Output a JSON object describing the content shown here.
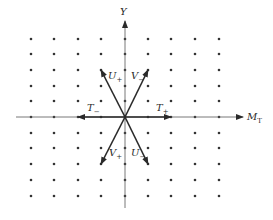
{
  "diagram": {
    "colors": {
      "background": "#ffffff",
      "ink": "#2a2a2a",
      "dot": "#333333"
    },
    "axes": {
      "x": {
        "label": "M",
        "subscript": "T"
      },
      "y": {
        "label": "Y"
      }
    },
    "grid": {
      "columns": 9,
      "rows": 11,
      "x_positions": [
        31,
        54,
        78,
        101,
        125,
        148,
        171,
        195,
        219
      ],
      "y_positions": [
        39,
        54,
        70,
        86,
        101,
        117,
        133,
        148,
        164,
        180,
        196
      ],
      "origin": [
        125,
        117
      ]
    },
    "operators": [
      {
        "id": "T_plus",
        "label": "T",
        "sign": "+",
        "to": [
          171,
          117
        ],
        "label_pos": [
          156,
          103
        ]
      },
      {
        "id": "T_minus",
        "label": "T",
        "sign": "−",
        "to": [
          78,
          117
        ],
        "label_pos": [
          87,
          103
        ]
      },
      {
        "id": "U_plus",
        "label": "U",
        "sign": "+",
        "to": [
          101,
          70
        ],
        "label_pos": [
          108,
          71
        ]
      },
      {
        "id": "V_minus",
        "label": "V",
        "sign": "−",
        "to": [
          148,
          70
        ],
        "label_pos": [
          131,
          71
        ]
      },
      {
        "id": "V_plus",
        "label": "V",
        "sign": "+",
        "to": [
          101,
          164
        ],
        "label_pos": [
          109,
          148
        ]
      },
      {
        "id": "U_minus",
        "label": "U",
        "sign": "−",
        "to": [
          148,
          164
        ],
        "label_pos": [
          131,
          148
        ]
      }
    ]
  }
}
